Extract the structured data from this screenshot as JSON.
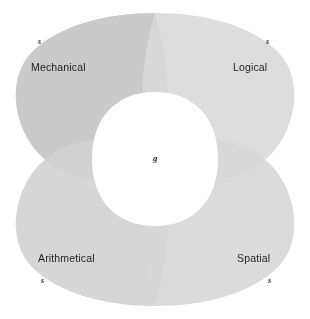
{
  "diagram": {
    "type": "four-petal-venn",
    "center_label": "g",
    "petals": [
      {
        "id": "mechanical",
        "label": "Mechanical",
        "mark": "s",
        "position": "top-left",
        "fill": "#c6c6c6"
      },
      {
        "id": "logical",
        "label": "Logical",
        "mark": "s",
        "position": "top-right",
        "fill": "#dadada"
      },
      {
        "id": "arithmetical",
        "label": "Arithmetical",
        "mark": "s",
        "position": "bottom-left",
        "fill": "#d2d2d2"
      },
      {
        "id": "spatial",
        "label": "Spatial",
        "mark": "s",
        "position": "bottom-right",
        "fill": "#d8d8d8"
      }
    ],
    "colors": {
      "background": "#ffffff",
      "center": "#ffffff",
      "overlap_dark": "#b4b4b4",
      "text": "#1f1f1f"
    }
  }
}
